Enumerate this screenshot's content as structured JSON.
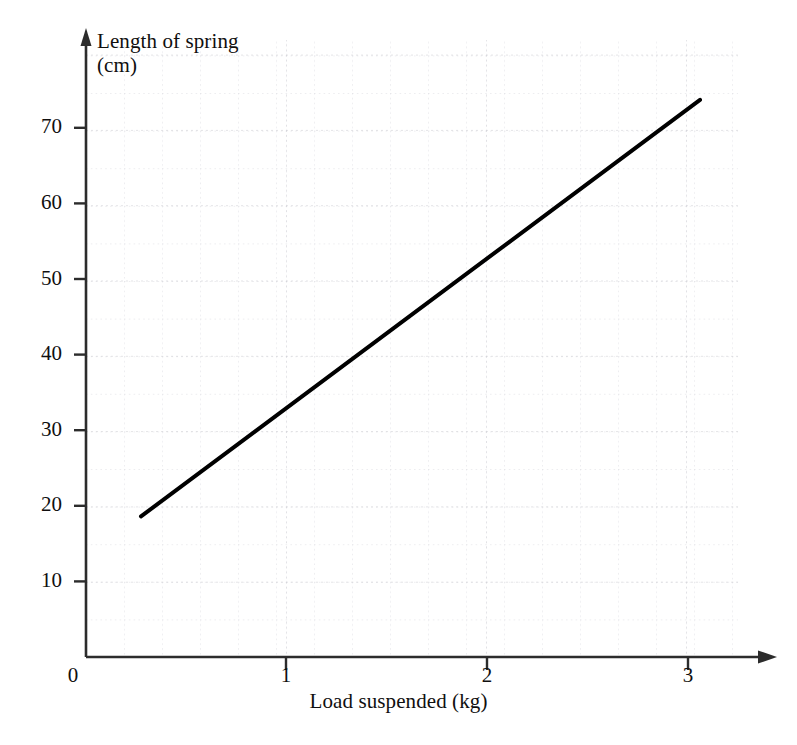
{
  "chart_data": {
    "type": "line",
    "title": "",
    "xlabel": "Load suspended (kg)",
    "ylabel": "Length of spring",
    "ylabel_units": "(cm)",
    "ylabel_full": "Length of spring\n(cm)",
    "xlim": [
      0,
      3.45
    ],
    "ylim": [
      0,
      79
    ],
    "grid": true,
    "grid_style": "dotted",
    "legend": "none",
    "x_ticks": [
      0,
      1,
      2,
      3
    ],
    "x_tick_labels": [
      "0",
      "1",
      "2",
      "3"
    ],
    "y_ticks": [
      0,
      10,
      20,
      30,
      40,
      50,
      60,
      70
    ],
    "y_tick_labels": [
      "0",
      "10",
      "20",
      "30",
      "40",
      "50",
      "60",
      "70"
    ],
    "x_minor_step": 0.2,
    "y_minor_step": 2,
    "series": [
      {
        "name": "Length of spring vs load",
        "x": [
          0.275,
          3.07
        ],
        "y": [
          18.6,
          73.7
        ],
        "points": [
          {
            "x": 0.275,
            "y": 18.6
          },
          {
            "x": 3.07,
            "y": 73.7
          }
        ],
        "slope": 19.7,
        "intercept": 13.2,
        "color": "#000000",
        "line_width": 4
      }
    ],
    "annotations": []
  },
  "axes": {
    "origin_label": "0",
    "y_axis_arrow": "arrow-up",
    "x_axis_arrow": "arrow-right",
    "axis_color": "#2c2c2c"
  },
  "colors": {
    "background": "#ffffff",
    "grid": "#d9d9de",
    "grid_major": "#cbcbd2",
    "axis": "#2c2c2c",
    "line": "#000000",
    "text": "#100f0f"
  }
}
